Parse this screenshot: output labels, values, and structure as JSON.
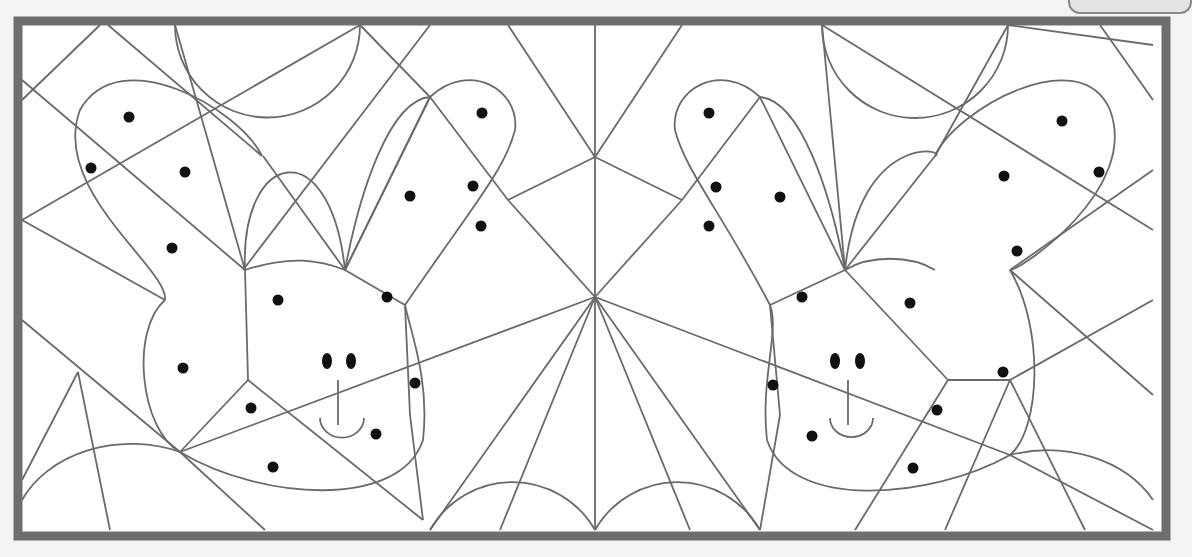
{
  "worksheet": {
    "title": "",
    "colors": {
      "frame": "#6e6e6e",
      "line": "#6a6a6a",
      "dot": "#111111",
      "paper": "#ffffff",
      "background": "#f4f4f2"
    },
    "frame": {
      "x": 18,
      "y": 21,
      "w": 1148,
      "h": 515,
      "stroke": 9
    }
  },
  "puzzle": {
    "type": "color-the-dotted-shapes hidden picture",
    "hidden_figures": [
      "bear-face-left",
      "bear-face-right"
    ],
    "lines": [
      [
        108,
        25,
        262,
        156
      ],
      [
        175,
        25,
        245,
        270
      ],
      [
        360,
        25,
        22,
        220
      ],
      [
        430,
        25,
        243,
        270
      ],
      [
        360,
        25,
        430,
        97
      ],
      [
        22,
        80,
        245,
        270
      ],
      [
        22,
        220,
        165,
        300
      ],
      [
        22,
        320,
        180,
        452
      ],
      [
        22,
        480,
        78,
        372
      ],
      [
        78,
        372,
        110,
        530
      ],
      [
        245,
        270,
        248,
        380
      ],
      [
        248,
        380,
        180,
        452
      ],
      [
        248,
        380,
        423,
        520
      ],
      [
        180,
        452,
        595,
        297
      ],
      [
        180,
        452,
        265,
        530
      ],
      [
        263,
        156,
        345,
        270
      ],
      [
        345,
        270,
        430,
        97
      ],
      [
        430,
        97,
        508,
        200
      ],
      [
        508,
        200,
        595,
        157
      ],
      [
        595,
        25,
        595,
        530
      ],
      [
        595,
        157,
        508,
        25
      ],
      [
        595,
        157,
        682,
        25
      ],
      [
        595,
        297,
        508,
        200
      ],
      [
        595,
        297,
        430,
        530
      ],
      [
        595,
        297,
        500,
        530
      ],
      [
        430,
        97,
        345,
        270
      ],
      [
        345,
        270,
        405,
        305
      ],
      [
        405,
        305,
        410,
        415
      ],
      [
        410,
        415,
        423,
        520
      ],
      [
        595,
        297,
        760,
        530
      ],
      [
        595,
        297,
        690,
        530
      ],
      [
        595,
        157,
        682,
        200
      ],
      [
        682,
        200,
        595,
        297
      ],
      [
        682,
        200,
        760,
        97
      ],
      [
        760,
        97,
        845,
        270
      ],
      [
        845,
        270,
        935,
        156
      ],
      [
        935,
        156,
        1008,
        25
      ],
      [
        822,
        25,
        1153,
        230
      ],
      [
        822,
        25,
        845,
        270
      ],
      [
        1008,
        25,
        1153,
        45
      ],
      [
        1153,
        170,
        1010,
        270
      ],
      [
        845,
        270,
        770,
        305
      ],
      [
        770,
        305,
        780,
        415
      ],
      [
        780,
        415,
        760,
        530
      ],
      [
        1010,
        270,
        1153,
        395
      ],
      [
        1153,
        300,
        1010,
        380
      ],
      [
        1010,
        380,
        1085,
        530
      ],
      [
        1010,
        380,
        945,
        530
      ],
      [
        845,
        270,
        948,
        380
      ],
      [
        948,
        380,
        1010,
        380
      ],
      [
        948,
        380,
        855,
        530
      ],
      [
        595,
        297,
        1010,
        455
      ],
      [
        1010,
        455,
        1153,
        530
      ],
      [
        100,
        25,
        22,
        100
      ],
      [
        1153,
        100,
        1100,
        25
      ]
    ],
    "arcs": [
      "M175,25 A60,60 0 0,0 360,25",
      "M822,25 A60,60 0 0,0 1008,25",
      "M22,500 A120,95 0 0,1 180,452",
      "M430,530 A95,95 0 0,1 595,530",
      "M595,530 A95,95 0 0,1 760,530",
      "M1010,455 A120,95 0 0,1 1153,500",
      "M245,270 C240,150 330,130 345,270",
      "M845,270 C860,130 950,150 935,156",
      "M262,156 C240,110 120,40 80,110 C50,190 170,270 165,300",
      "M935,156 C955,110 1080,40 1110,110 C1140,190 1020,270 1010,270",
      "M345,270 C360,190 390,100 430,97 C470,60 520,90 515,130 C505,170 470,210 405,305",
      "M845,270 C830,190 800,100 760,97 C720,60 670,90 675,130 C685,170 720,210 770,305",
      "M165,300 C130,330 140,430 180,452 C260,500 400,510 423,440 C430,380 410,330 405,305",
      "M1010,270 C1045,330 1040,430 1010,455 C930,500 790,510 767,440 C760,380 780,330 770,305",
      "M245,270 C290,255 320,260 345,270",
      "M845,270 C870,255 910,255 935,270"
    ],
    "dots": [
      [
        129,
        117
      ],
      [
        91,
        168
      ],
      [
        185,
        172
      ],
      [
        172,
        248
      ],
      [
        278,
        300
      ],
      [
        183,
        368
      ],
      [
        251,
        408
      ],
      [
        273,
        467
      ],
      [
        376,
        434
      ],
      [
        415,
        383
      ],
      [
        387,
        297
      ],
      [
        410,
        196
      ],
      [
        473,
        186
      ],
      [
        481,
        226
      ],
      [
        482,
        113
      ],
      [
        709,
        113
      ],
      [
        716,
        187
      ],
      [
        709,
        226
      ],
      [
        780,
        197
      ],
      [
        802,
        297
      ],
      [
        773,
        385
      ],
      [
        812,
        436
      ],
      [
        913,
        468
      ],
      [
        937,
        410
      ],
      [
        910,
        303
      ],
      [
        1003,
        372
      ],
      [
        1017,
        251
      ],
      [
        1004,
        176
      ],
      [
        1062,
        121
      ],
      [
        1099,
        172
      ]
    ],
    "faces": [
      {
        "eyes": [
          [
            327,
            361
          ],
          [
            351,
            361
          ]
        ],
        "nose": [
          338,
          380,
          338,
          425
        ],
        "mouth": "M320,418 A18,16 0 0,0 364,418"
      },
      {
        "eyes": [
          [
            835,
            361
          ],
          [
            860,
            361
          ]
        ],
        "nose": [
          848,
          380,
          848,
          425
        ],
        "mouth": "M830,418 A18,16 0 0,0 873,418"
      }
    ]
  }
}
